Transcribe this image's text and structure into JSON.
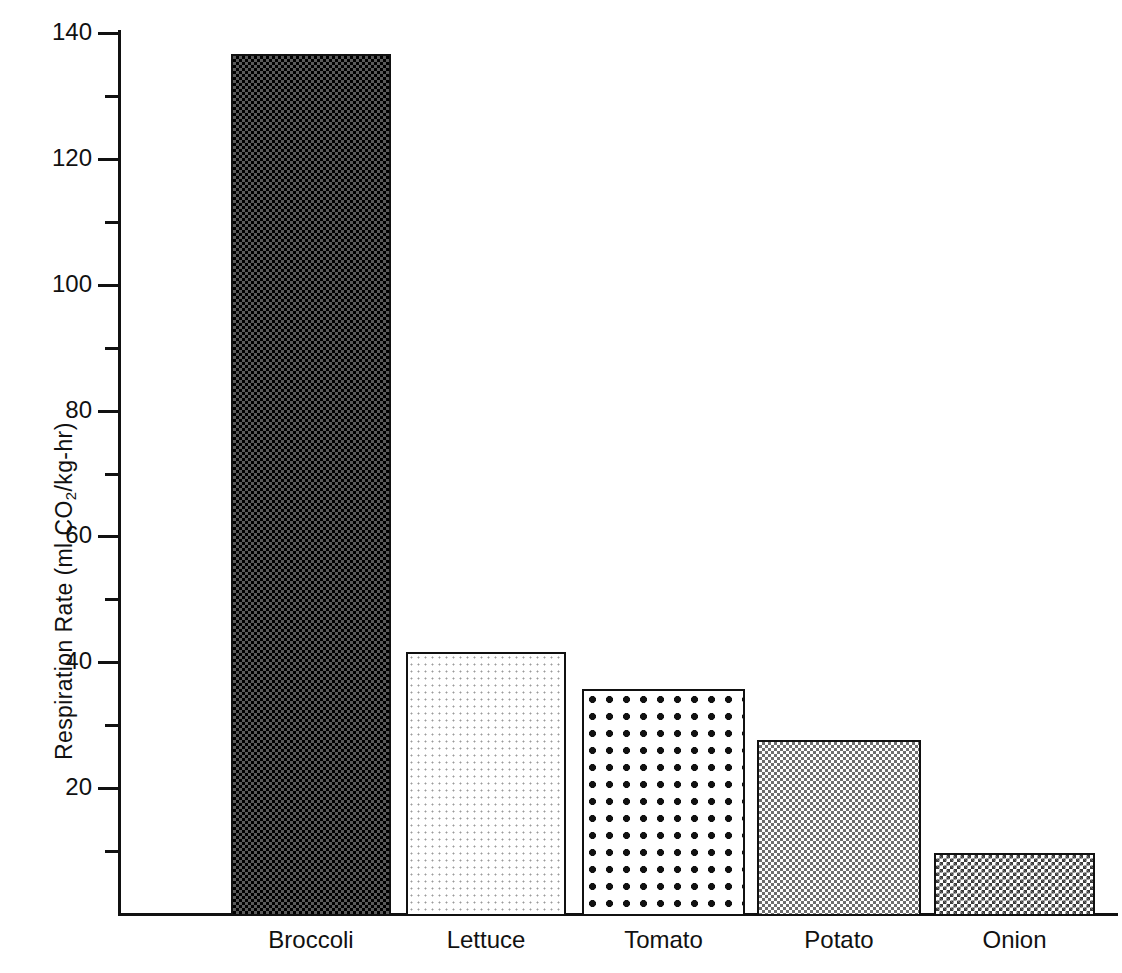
{
  "chart_data": {
    "type": "bar",
    "title": "",
    "subtitle": "",
    "xlabel": "",
    "ylabel": "Respiration Rate (ml CO2/kg-hr)",
    "ylabel_parts": {
      "prefix": "Respiration Rate (ml CO",
      "subscript": "2",
      "suffix": "/kg-hr)"
    },
    "categories": [
      "Broccoli",
      "Lettuce",
      "Tomato",
      "Potato",
      "Onion"
    ],
    "values": [
      137,
      42,
      36,
      28,
      10
    ],
    "ylim": [
      0,
      140
    ],
    "y_major_ticks": [
      20,
      40,
      60,
      80,
      100,
      120,
      140
    ],
    "y_minor_ticks": [
      10,
      30,
      50,
      70,
      90,
      110,
      130
    ],
    "y_tick_labels": [
      "20",
      "40",
      "60",
      "80",
      "100",
      "120",
      "140"
    ],
    "grid": false,
    "legend": "none",
    "bar_fills": [
      "dense-dark-checker",
      "light-sparse-dots",
      "large-bold-dots",
      "medium-gray-checker",
      "fine-dark-checker"
    ],
    "colors": {
      "axis": "#111111",
      "text": "#111111",
      "background": "#ffffff"
    }
  }
}
